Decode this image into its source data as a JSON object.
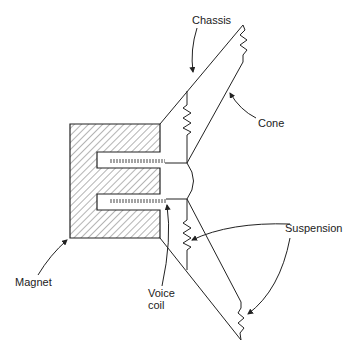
{
  "diagram": {
    "labels": {
      "chassis": "Chassis",
      "cone": "Cone",
      "suspension": "Suspension",
      "magnet": "Magnet",
      "voice_coil_line1": "Voice",
      "voice_coil_line2": "coil"
    },
    "colors": {
      "line": "#222222",
      "background": "#ffffff"
    }
  }
}
